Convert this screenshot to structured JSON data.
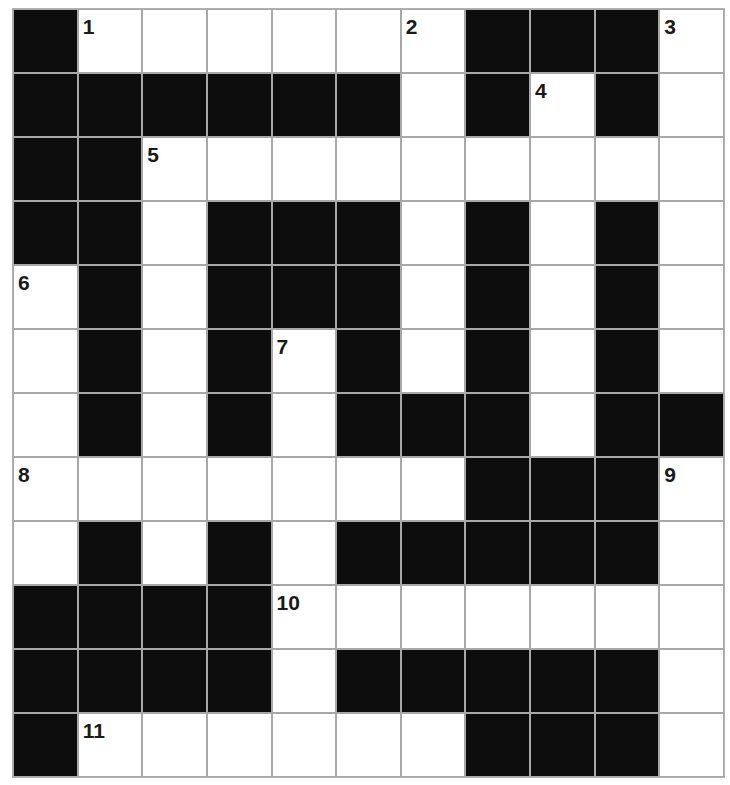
{
  "puzzle": {
    "cols": 11,
    "rows": 12,
    "colors": {
      "block": "#0d0d0d",
      "open": "#ffffff",
      "gridline": "#a8a8a8",
      "number": "#1a1a1a"
    },
    "layout": [
      "#......###.",
      "######.#.#.",
      "##.........",
      "##.###.#.#.",
      ".#.###.#.#.",
      ".#.#.#.#.#.",
      ".#.#.###.##",
      ".......###.",
      ".#.#.#####.",
      "####.......",
      "####.#####.",
      "#......###."
    ],
    "numbers": [
      {
        "label": "1",
        "row": 0,
        "col": 1
      },
      {
        "label": "2",
        "row": 0,
        "col": 6
      },
      {
        "label": "3",
        "row": 0,
        "col": 10
      },
      {
        "label": "4",
        "row": 1,
        "col": 8
      },
      {
        "label": "5",
        "row": 2,
        "col": 2
      },
      {
        "label": "6",
        "row": 4,
        "col": 0
      },
      {
        "label": "7",
        "row": 5,
        "col": 4
      },
      {
        "label": "8",
        "row": 7,
        "col": 0
      },
      {
        "label": "9",
        "row": 7,
        "col": 10
      },
      {
        "label": "10",
        "row": 9,
        "col": 4
      },
      {
        "label": "11",
        "row": 11,
        "col": 1
      }
    ]
  }
}
